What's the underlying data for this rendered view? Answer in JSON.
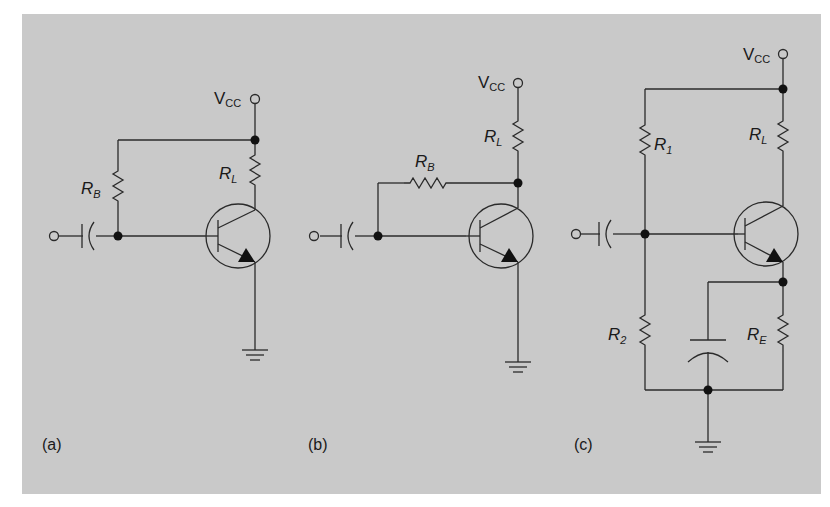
{
  "figure": {
    "background": "#c9c9c9",
    "ink": "#2a2a2a",
    "panels": [
      {
        "id": "a",
        "caption": "(a)",
        "description": "Fixed-bias: RB from VCC node to base",
        "labels": {
          "vcc": "V",
          "vcc_sub": "CC",
          "rb": "R",
          "rb_sub": "B",
          "rl": "R",
          "rl_sub": "L"
        }
      },
      {
        "id": "b",
        "caption": "(b)",
        "description": "Collector-feedback bias: RB from collector to base",
        "labels": {
          "vcc": "V",
          "vcc_sub": "CC",
          "rb": "R",
          "rb_sub": "B",
          "rl": "R",
          "rl_sub": "L"
        }
      },
      {
        "id": "c",
        "caption": "(c)",
        "description": "Voltage-divider bias with emitter resistor and bypass capacitor",
        "labels": {
          "vcc": "V",
          "vcc_sub": "CC",
          "r1": "R",
          "r1_sub": "1",
          "r2": "R",
          "r2_sub": "2",
          "rl": "R",
          "rl_sub": "L",
          "re": "R",
          "re_sub": "E"
        }
      }
    ]
  }
}
